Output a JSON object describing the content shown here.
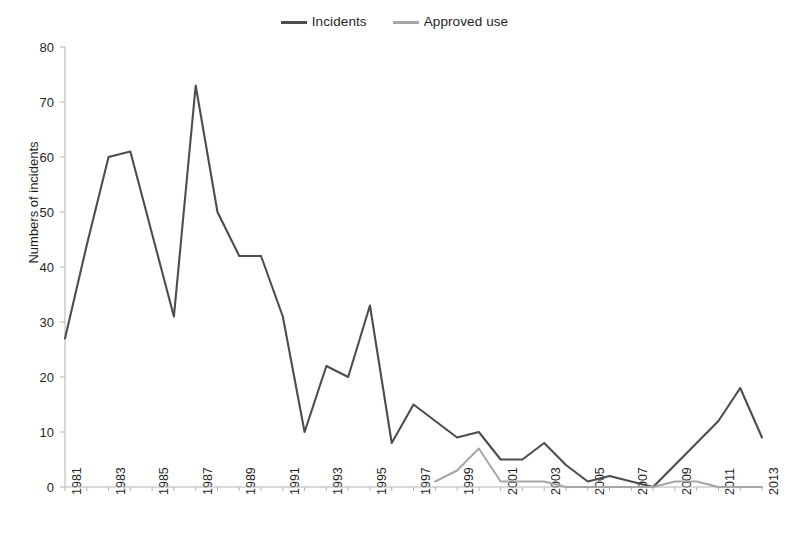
{
  "chart_data": {
    "type": "line",
    "title": "",
    "xlabel": "",
    "ylabel": "Numbers of incidents",
    "xlim": [
      1981,
      2013
    ],
    "ylim": [
      0,
      80
    ],
    "yticks": [
      0,
      10,
      20,
      30,
      40,
      50,
      60,
      70,
      80
    ],
    "xticks": [
      1981,
      1983,
      1985,
      1987,
      1989,
      1991,
      1993,
      1995,
      1997,
      1999,
      2001,
      2003,
      2005,
      2007,
      2009,
      2011,
      2013
    ],
    "x": [
      1981,
      1982,
      1983,
      1984,
      1985,
      1986,
      1987,
      1988,
      1989,
      1990,
      1991,
      1992,
      1993,
      1994,
      1995,
      1996,
      1997,
      1998,
      1999,
      2000,
      2001,
      2002,
      2003,
      2004,
      2005,
      2006,
      2007,
      2008,
      2009,
      2010,
      2011,
      2012,
      2013
    ],
    "grid": false,
    "legend_position": "top-center",
    "series": [
      {
        "name": "Incidents",
        "color": "#4d4d4d",
        "values": [
          27,
          44,
          60,
          61,
          46,
          31,
          73,
          50,
          42,
          42,
          31,
          10,
          22,
          20,
          33,
          8,
          15,
          12,
          9,
          10,
          5,
          5,
          8,
          4,
          1,
          2,
          1,
          0,
          4,
          8,
          12,
          18,
          9
        ]
      },
      {
        "name": "Approved use",
        "color": "#a6a6a6",
        "values": [
          null,
          null,
          null,
          null,
          null,
          null,
          null,
          null,
          null,
          null,
          null,
          null,
          null,
          null,
          null,
          null,
          null,
          1,
          3,
          7,
          1,
          1,
          1,
          0,
          0,
          0,
          0,
          0,
          1,
          1,
          0,
          0,
          0
        ]
      }
    ]
  }
}
